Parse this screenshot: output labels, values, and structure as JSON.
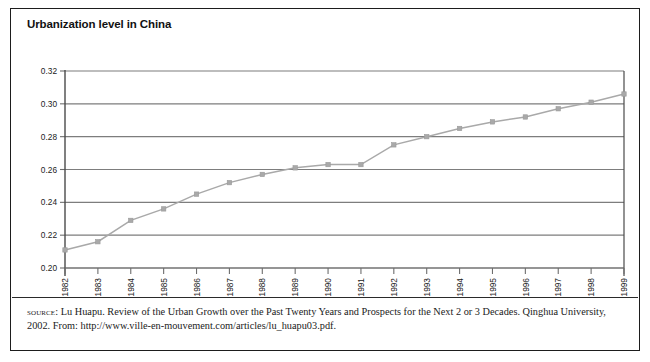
{
  "figure": {
    "title": "Urbanization level in China",
    "border_color": "#1d1d1d",
    "background": "#ffffff"
  },
  "source": {
    "label": "source:",
    "text": " Lu Huapu. Review of the Urban Growth over the Past Twenty Years and Prospects for the Next 2 or 3 Decades. Qinghua University, 2002. From: http://www.ville-en-mouvement.com/articles/lu_huapu03.pdf."
  },
  "chart_data": {
    "type": "line",
    "title": "Urbanization level in China",
    "xlabel": "",
    "ylabel": "",
    "x": [
      1982,
      1983,
      1984,
      1985,
      1986,
      1987,
      1988,
      1989,
      1990,
      1991,
      1992,
      1993,
      1994,
      1995,
      1996,
      1997,
      1998,
      1999
    ],
    "categories": [
      "1982",
      "1983",
      "1984",
      "1985",
      "1986",
      "1987",
      "1988",
      "1989",
      "1990",
      "1991",
      "1992",
      "1993",
      "1994",
      "1995",
      "1996",
      "1997",
      "1998",
      "1999"
    ],
    "values": [
      0.211,
      0.216,
      0.229,
      0.236,
      0.245,
      0.252,
      0.257,
      0.261,
      0.263,
      0.263,
      0.275,
      0.28,
      0.285,
      0.289,
      0.292,
      0.297,
      0.301,
      0.306
    ],
    "ylim": [
      0.2,
      0.32
    ],
    "yticks": [
      0.2,
      0.22,
      0.24,
      0.26,
      0.28,
      0.3,
      0.32
    ],
    "ytick_labels": [
      "0.20",
      "0.22",
      "0.24",
      "0.26",
      "0.28",
      "0.30",
      "0.32"
    ],
    "grid": true,
    "grid_axis": "y",
    "legend": false,
    "legend_position": "none",
    "marker": "square",
    "series_color": "#a9a9a9",
    "gridline_color": "#7d7d7d",
    "axis_color": "#6e6e6e",
    "xtick_label_rotation": -90
  }
}
